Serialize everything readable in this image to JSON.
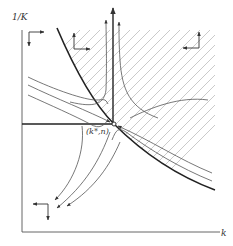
{
  "diagram": {
    "type": "phase-diagram",
    "y_axis_label": "1/K",
    "x_axis_label": "k",
    "equilibrium_label": "(k*,n)",
    "regions": [
      {
        "name": "hatched-region",
        "description": "area above/right of boundary curve, hatched with diagonal lines"
      }
    ],
    "direction_indicators": [
      {
        "position": "top-left",
        "arrows": [
          "right",
          "down"
        ]
      },
      {
        "position": "top-middle",
        "arrows": [
          "up",
          "right"
        ]
      },
      {
        "position": "top-right",
        "arrows": [
          "up",
          "left"
        ]
      },
      {
        "position": "bottom-left",
        "arrows": [
          "left",
          "down"
        ]
      }
    ],
    "trajectories": [
      "saddle-path stable arms converge to equilibrium",
      "unstable arms diverge upward and toward lower-left"
    ],
    "colors": {
      "line": "#333333",
      "hatch": "#b8b8b8",
      "background": "#ffffff"
    }
  }
}
